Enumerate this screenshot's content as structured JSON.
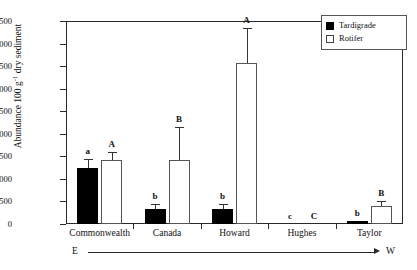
{
  "chart_data": {
    "type": "bar",
    "title": "",
    "xlabel": "",
    "ylabel": "Abundance 100 g−1 dry sediment",
    "ylabel_prefix": "Abundance 100 g",
    "ylabel_exponent": "-1",
    "ylabel_suffix": " dry sediment",
    "ylim": [
      0,
      4500
    ],
    "yticks": [
      0,
      500,
      1000,
      1500,
      2000,
      2500,
      3000,
      3500,
      4000,
      4500
    ],
    "grid": false,
    "legend_position": "top-right",
    "categories": [
      "Commonwealth",
      "Canada",
      "Howard",
      "Hughes",
      "Taylor"
    ],
    "series": [
      {
        "name": "Tardigrade",
        "style": "filled",
        "color": "#000000",
        "values": [
          1250,
          330,
          330,
          0,
          60
        ],
        "errors": [
          200,
          110,
          110,
          0,
          0
        ],
        "letters": [
          "a",
          "b",
          "b",
          "c",
          "b"
        ]
      },
      {
        "name": "Rotifer",
        "style": "open",
        "color": "#ffffff",
        "values": [
          1420,
          1420,
          3580,
          0,
          390
        ],
        "errors": [
          180,
          730,
          770,
          0,
          120
        ],
        "letters": [
          "A",
          "B",
          "A",
          "C",
          "B"
        ]
      }
    ],
    "direction_axis": {
      "left": "E",
      "right": "W"
    }
  },
  "legend": {
    "items": [
      {
        "label": "Tardigrade",
        "style": "filled"
      },
      {
        "label": "Rotifer",
        "style": "open"
      }
    ]
  }
}
